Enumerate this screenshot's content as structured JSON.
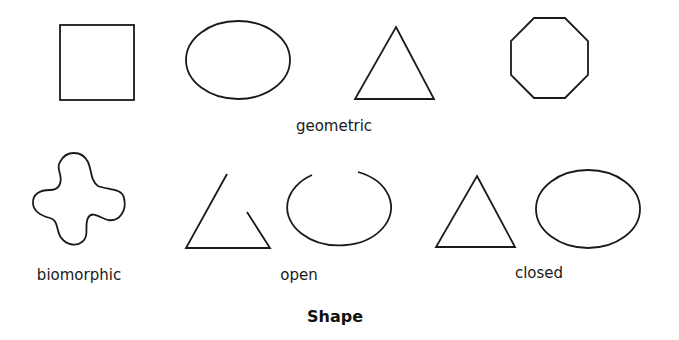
{
  "figure": {
    "title": "Shape",
    "groups": [
      {
        "label": "geometric",
        "shapes": [
          "square",
          "ellipse",
          "triangle",
          "octagon"
        ]
      },
      {
        "label": "biomorphic",
        "shapes": [
          "biomorphic-blob"
        ]
      },
      {
        "label": "open",
        "shapes": [
          "open-triangle",
          "open-ellipse"
        ]
      },
      {
        "label": "closed",
        "shapes": [
          "closed-triangle",
          "closed-ellipse"
        ]
      }
    ],
    "colors": {
      "stroke": "#1a1a1a",
      "background": "#ffffff"
    }
  }
}
